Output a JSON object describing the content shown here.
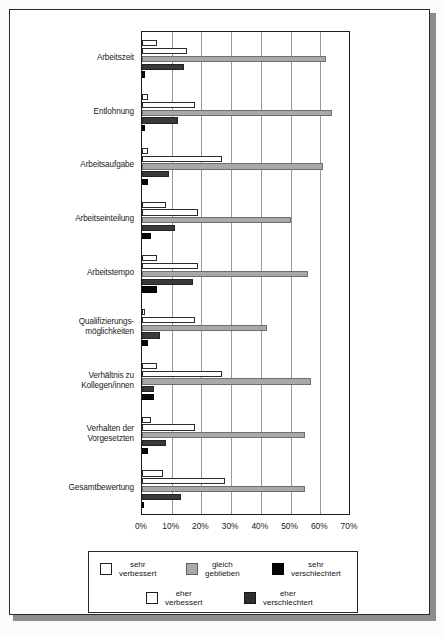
{
  "chart_data": {
    "type": "bar",
    "orientation": "horizontal",
    "title": "",
    "xlabel": "",
    "ylabel": "",
    "xlim": [
      0,
      70
    ],
    "xticks": [
      "0%",
      "10%",
      "20%",
      "30%",
      "40%",
      "50%",
      "60%",
      "70%"
    ],
    "xtick_values": [
      0,
      10,
      20,
      30,
      40,
      50,
      60,
      70
    ],
    "grid": true,
    "legend_position": "bottom",
    "categories": [
      "Arbeitszeit",
      "Entlohnung",
      "Arbeitsaufgabe",
      "Arbeitseinteilung",
      "Arbeitstempo",
      "Qualifizierungs-\nmöglichkeiten",
      "Verhältnis zu\nKollegen/innen",
      "Verhalten der\nVorgesetzten",
      "Gesamtbewertung"
    ],
    "series": [
      {
        "name": "sehr verbessert",
        "color": "#ffffff",
        "values": [
          5,
          2,
          2,
          8,
          5,
          1,
          5,
          3,
          7
        ]
      },
      {
        "name": "eher verbessert",
        "color": "#ffffff",
        "values": [
          15,
          18,
          27,
          19,
          19,
          18,
          27,
          18,
          28
        ]
      },
      {
        "name": "gleich geblieben",
        "color": "#a8a8a8",
        "values": [
          62,
          64,
          61,
          50,
          56,
          42,
          57,
          55,
          55
        ]
      },
      {
        "name": "eher verschlechtert",
        "color": "#3a3a3a",
        "values": [
          14,
          12,
          9,
          11,
          17,
          6,
          4,
          8,
          13
        ]
      },
      {
        "name": "sehr verschlechtert",
        "color": "#080808",
        "values": [
          1,
          1,
          2,
          3,
          5,
          2,
          4,
          2,
          0
        ]
      }
    ]
  },
  "legend": {
    "row1": [
      {
        "swatch": "sw-white",
        "label": "sehr\nverbessert"
      },
      {
        "swatch": "sw-gray",
        "label": "gleich\ngeblieben"
      },
      {
        "swatch": "sw-black",
        "label": "sehr\nverschlechtert"
      }
    ],
    "row2": [
      {
        "swatch": "sw-white",
        "label": "eher\nverbessert"
      },
      {
        "swatch": "sw-dark",
        "label": "eher\nverschlechtert"
      }
    ]
  }
}
